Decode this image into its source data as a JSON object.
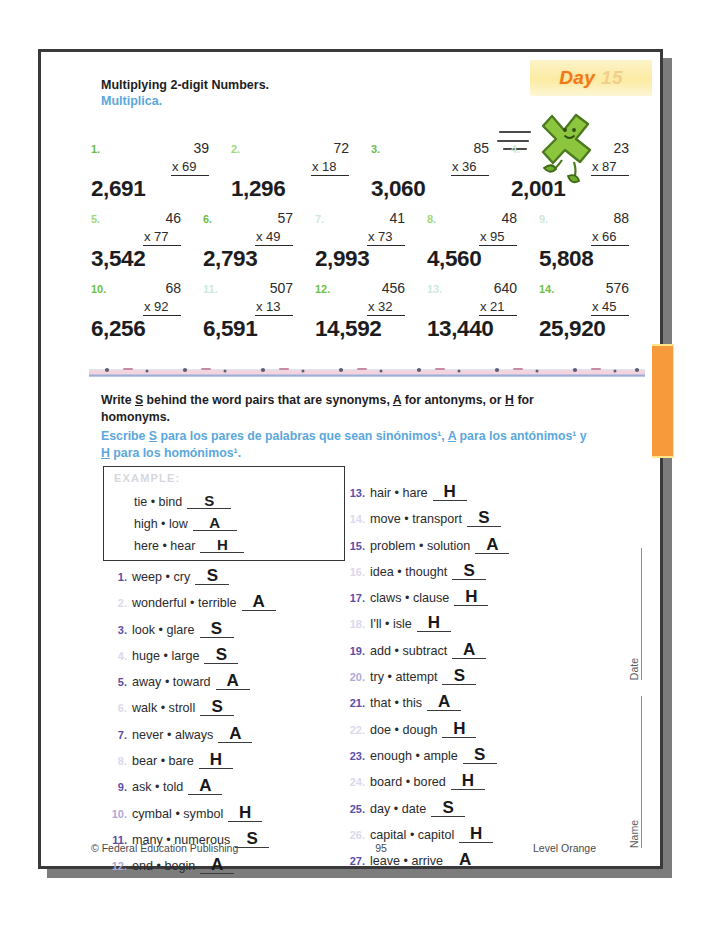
{
  "badge": {
    "word": "Day",
    "number": "15"
  },
  "header": {
    "title_en": "Multiplying 2-digit Numbers.",
    "title_es": "Multiplica."
  },
  "mascot": {
    "name": "green-x-character-running"
  },
  "math": {
    "rows": [
      [
        {
          "num": "1.",
          "top": "39",
          "mult": "x 69",
          "answer": "2,691",
          "shade": "c-strong"
        },
        {
          "num": "2.",
          "top": "72",
          "mult": "x 18",
          "answer": "1,296",
          "shade": "c-mid"
        },
        {
          "num": "3.",
          "top": "85",
          "mult": "x 36",
          "answer": "3,060",
          "shade": "c-strong"
        },
        {
          "num": "4.",
          "top": "23",
          "mult": "x 87",
          "answer": "2,001",
          "shade": "c-faint"
        }
      ],
      [
        {
          "num": "5.",
          "top": "46",
          "mult": "x 77",
          "answer": "3,542",
          "shade": "c-mid"
        },
        {
          "num": "6.",
          "top": "57",
          "mult": "x 49",
          "answer": "2,793",
          "shade": "c-strong"
        },
        {
          "num": "7.",
          "top": "41",
          "mult": "x 73",
          "answer": "2,993",
          "shade": "c-faint"
        },
        {
          "num": "8.",
          "top": "48",
          "mult": "x 95",
          "answer": "4,560",
          "shade": "c-mid"
        },
        {
          "num": "9.",
          "top": "88",
          "mult": "x 66",
          "answer": "5,808",
          "shade": "c-faint"
        }
      ],
      [
        {
          "num": "10.",
          "top": "68",
          "mult": "x 92",
          "answer": "6,256",
          "shade": "c-strong"
        },
        {
          "num": "11.",
          "top": "507",
          "mult": "x 13",
          "answer": "6,591",
          "shade": "c-faint"
        },
        {
          "num": "12.",
          "top": "456",
          "mult": "x 32",
          "answer": "14,592",
          "shade": "c-strong"
        },
        {
          "num": "13.",
          "top": "640",
          "mult": "x 21",
          "answer": "13,440",
          "shade": "c-faint"
        },
        {
          "num": "14.",
          "top": "576",
          "mult": "x 45",
          "answer": "25,920",
          "shade": "c-strong"
        }
      ]
    ]
  },
  "instructions": {
    "en_part1": "Write ",
    "en_s": "S",
    "en_part2": " behind the word pairs that are synonyms, ",
    "en_a": "A",
    "en_part3": " for antonyms, or ",
    "en_h": "H",
    "en_part4": " for homonyms.",
    "es_part1": "Escribe ",
    "es_s": "S",
    "es_part2": " para los pares de palabras que sean sinónimos¹, ",
    "es_a": "A",
    "es_part3": " para los antónimos¹ y ",
    "es_h": "H",
    "es_part4": " para los homónimos¹."
  },
  "example": {
    "label": "EXAMPLE:",
    "rows": [
      {
        "words": "tie • bind",
        "answer": "S"
      },
      {
        "words": "high • low",
        "answer": "A"
      },
      {
        "words": "here • hear",
        "answer": "H"
      }
    ]
  },
  "word_pairs_left": [
    {
      "idx": "1.",
      "words": "weep • cry",
      "answer": "S",
      "shade": "i-strong"
    },
    {
      "idx": "2.",
      "words": "wonderful • terrible",
      "answer": "A",
      "shade": "i-faint"
    },
    {
      "idx": "3.",
      "words": "look • glare",
      "answer": "S",
      "shade": "i-strong"
    },
    {
      "idx": "4.",
      "words": "huge • large",
      "answer": "S",
      "shade": "i-faint"
    },
    {
      "idx": "5.",
      "words": "away • toward",
      "answer": "A",
      "shade": "i-strong"
    },
    {
      "idx": "6.",
      "words": "walk • stroll",
      "answer": "S",
      "shade": "i-faint"
    },
    {
      "idx": "7.",
      "words": "never • always",
      "answer": "A",
      "shade": "i-strong"
    },
    {
      "idx": "8.",
      "words": "bear • bare",
      "answer": "H",
      "shade": "i-faint"
    },
    {
      "idx": "9.",
      "words": "ask • told",
      "answer": "A",
      "shade": "i-strong"
    },
    {
      "idx": "10.",
      "words": "cymbal • symbol",
      "answer": "H",
      "shade": "i-mid"
    },
    {
      "idx": "11.",
      "words": "many • numerous",
      "answer": "S",
      "shade": "i-strong"
    },
    {
      "idx": "12.",
      "words": "end • begin",
      "answer": "A",
      "shade": "i-mid"
    }
  ],
  "word_pairs_right": [
    {
      "idx": "13.",
      "words": "hair • hare",
      "answer": "H",
      "shade": "i-strong"
    },
    {
      "idx": "14.",
      "words": "move • transport",
      "answer": "S",
      "shade": "i-faint"
    },
    {
      "idx": "15.",
      "words": "problem • solution",
      "answer": "A",
      "shade": "i-strong"
    },
    {
      "idx": "16.",
      "words": "idea • thought",
      "answer": "S",
      "shade": "i-faint"
    },
    {
      "idx": "17.",
      "words": "claws • clause",
      "answer": "H",
      "shade": "i-strong"
    },
    {
      "idx": "18.",
      "words": "I'll • isle",
      "answer": "H",
      "shade": "i-faint"
    },
    {
      "idx": "19.",
      "words": "add • subtract",
      "answer": "A",
      "shade": "i-strong"
    },
    {
      "idx": "20.",
      "words": "try • attempt",
      "answer": "S",
      "shade": "i-mid"
    },
    {
      "idx": "21.",
      "words": "that • this",
      "answer": "A",
      "shade": "i-strong"
    },
    {
      "idx": "22.",
      "words": "doe • dough",
      "answer": "H",
      "shade": "i-faint"
    },
    {
      "idx": "23.",
      "words": "enough • ample",
      "answer": "S",
      "shade": "i-strong"
    },
    {
      "idx": "24.",
      "words": "board • bored",
      "answer": "H",
      "shade": "i-faint"
    },
    {
      "idx": "25.",
      "words": "day • date",
      "answer": "S",
      "shade": "i-strong"
    },
    {
      "idx": "26.",
      "words": "capital • capitol",
      "answer": "H",
      "shade": "i-faint"
    },
    {
      "idx": "27.",
      "words": "leave • arrive",
      "answer": "A",
      "shade": "i-strong"
    }
  ],
  "margin": {
    "date_label": "Date",
    "name_label": "Name"
  },
  "footer": {
    "copyright": "© Federal Education Publishing",
    "page_number": "95",
    "level": "Level Orange"
  },
  "colors": {
    "math_number_green": "#6fbe4a",
    "list_number_purple": "#5a4ea8",
    "spanish_blue": "#5ba7dd",
    "badge_orange": "#f07a17",
    "tab_orange": "#f79a3c"
  }
}
